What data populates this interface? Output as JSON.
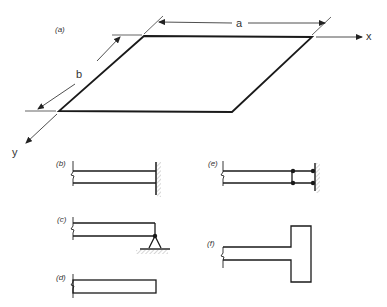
{
  "figure": {
    "panel_a": {
      "label": "(a)",
      "dimension_a": "a",
      "dimension_b": "b",
      "x_axis": "x",
      "y_axis": "y",
      "description": "Rectangular plate with sides a (along x) and b (along y)"
    },
    "panel_b": {
      "label": "(b)",
      "description": "Clamped edge"
    },
    "panel_c": {
      "label": "(c)",
      "description": "Simply supported edge"
    },
    "panel_d": {
      "label": "(d)",
      "description": "Free edge"
    },
    "panel_e": {
      "label": "(e)",
      "description": "Sliding / guided edge"
    },
    "panel_f": {
      "label": "(f)",
      "description": "Edge stiffened by a beam"
    }
  },
  "colors": {
    "line": "#1a1a1a",
    "hatch": "#888888"
  }
}
